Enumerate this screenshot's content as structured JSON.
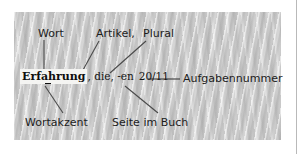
{
  "figure": {
    "panel_color": "#c9c9c9",
    "text_color": "#1c1c1c",
    "line_color": "#4a4a4a",
    "highlight_color": "#f4f4f2"
  },
  "entry": {
    "headword": "Erfahrung",
    "grammar": ", die, -en",
    "page_reference": "20/11"
  },
  "labels": {
    "wort": "Wort",
    "artikel": "Artikel,",
    "plural": "Plural",
    "aufgabennummer": "Aufgabennummer",
    "wortakzent": "Wortakzent",
    "seite_im_buch": "Seite im Buch"
  },
  "leader_lines": [
    {
      "name": "wort-leader",
      "from": [
        44,
        40
      ],
      "to": [
        44,
        71
      ]
    },
    {
      "name": "artikel-leader",
      "from": [
        99,
        41
      ],
      "to": [
        83,
        70
      ]
    },
    {
      "name": "plural-leader",
      "from": [
        146,
        41
      ],
      "to": [
        110,
        73
      ]
    },
    {
      "name": "aufgabennummer-leader",
      "from": [
        148,
        79
      ],
      "to": [
        180,
        79
      ]
    },
    {
      "name": "wortakzent-leader",
      "from": [
        45,
        86
      ],
      "to": [
        63,
        113
      ]
    },
    {
      "name": "seite-im-buch-leader",
      "from": [
        125,
        86
      ],
      "to": [
        158,
        113
      ]
    }
  ]
}
